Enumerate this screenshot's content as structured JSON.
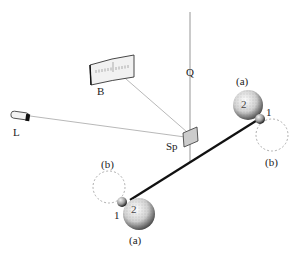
{
  "diagram": {
    "labels": {
      "fiber": "Q",
      "scale": "B",
      "lamp": "L",
      "mirror": "Sp",
      "position_a_top": "(a)",
      "position_b_top": "(b)",
      "position_a_bottom": "(a)",
      "position_b_bottom": "(b)",
      "small_ball_top": "1",
      "large_ball_top": "2",
      "small_ball_bottom": "1",
      "large_ball_bottom": "2"
    },
    "colors": {
      "line": "#8a8a8a",
      "rod": "#111111",
      "dashed": "#9a9a9a",
      "ball": "#d8d8d8"
    }
  }
}
